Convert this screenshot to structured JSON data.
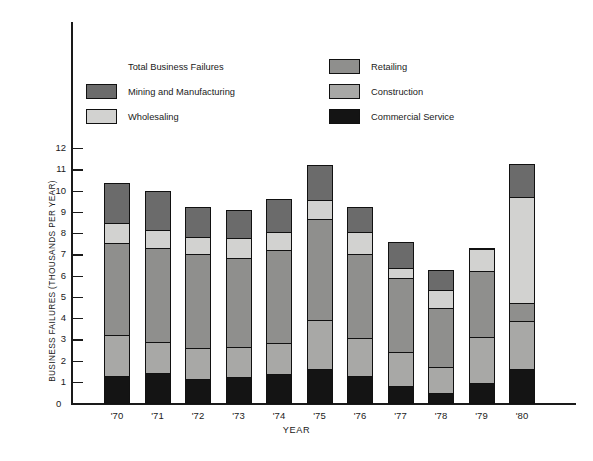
{
  "axes": {
    "y_title": "BUSINESS FAILURES (THOUSANDS PER YEAR)",
    "x_title": "YEAR",
    "zero_label": "0",
    "y_ticks": [
      "12",
      "11",
      "10",
      "9",
      "8",
      "7",
      "6",
      "5",
      "4",
      "3",
      "2",
      "1"
    ]
  },
  "legend": {
    "heading": "Total Business Failures",
    "left_items": [
      {
        "label": "Mining and Manufacturing",
        "color": "#6b6b6b",
        "key": "mining_and_manufacturing"
      },
      {
        "label": "Wholesaling",
        "color": "#d2d2d0",
        "key": "wholesaling"
      }
    ],
    "right_items": [
      {
        "label": "Retailing",
        "color": "#8f8f8d",
        "key": "retailing"
      },
      {
        "label": "Construction",
        "color": "#a8a8a6",
        "key": "construction"
      },
      {
        "label": "Commercial Service",
        "color": "#141414",
        "key": "commercial_service"
      }
    ]
  },
  "chart_data": {
    "type": "bar",
    "stacked": true,
    "title": "Total Business Failures",
    "xlabel": "YEAR",
    "ylabel": "BUSINESS FAILURES (THOUSANDS PER YEAR)",
    "ylim": [
      0,
      12
    ],
    "grid": false,
    "legend_position": "top-inside",
    "categories": [
      "'70",
      "'71",
      "'72",
      "'73",
      "'74",
      "'75",
      "'76",
      "'77",
      "'78",
      "'79",
      "'80"
    ],
    "series": [
      {
        "name": "Commercial Service",
        "color": "#141414",
        "values": [
          1.3,
          1.45,
          1.2,
          1.25,
          1.4,
          1.65,
          1.3,
          0.85,
          0.5,
          1.0,
          1.65
        ]
      },
      {
        "name": "Construction",
        "color": "#a8a8a6",
        "values": [
          2.0,
          1.55,
          1.5,
          1.5,
          1.55,
          2.35,
          1.85,
          1.65,
          1.3,
          2.2,
          2.3
        ]
      },
      {
        "name": "Retailing",
        "color": "#8f8f8d",
        "values": [
          4.4,
          4.45,
          4.5,
          4.25,
          4.45,
          4.85,
          4.05,
          3.55,
          2.85,
          3.2,
          0.95
        ]
      },
      {
        "name": "Wholesaling",
        "color": "#d2d2d0",
        "values": [
          1.0,
          0.95,
          0.85,
          1.0,
          0.9,
          0.95,
          1.1,
          0.55,
          0.9,
          1.1,
          5.05
        ]
      },
      {
        "name": "Mining and Manufacturing",
        "color": "#6b6b6b",
        "values": [
          1.95,
          1.9,
          1.5,
          1.4,
          1.6,
          1.7,
          1.25,
          1.3,
          1.0,
          0.05,
          1.6
        ]
      }
    ],
    "totals": [
      10.65,
      10.3,
      9.55,
      9.4,
      9.9,
      11.5,
      9.55,
      7.9,
      6.55,
      7.55,
      11.55
    ]
  }
}
